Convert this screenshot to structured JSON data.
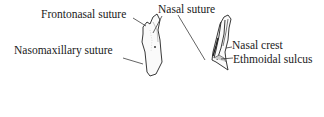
{
  "figure": {
    "left_view": {
      "labels": {
        "frontonasal": "Frontonasal suture",
        "nasal_suture": "Nasal suture",
        "nasomaxillary": "Nasomaxillary suture"
      }
    },
    "right_view": {
      "labels": {
        "nasal_crest": "Nasal crest",
        "ethmoidal_sulcus": "Ethmoidal sulcus"
      }
    }
  }
}
